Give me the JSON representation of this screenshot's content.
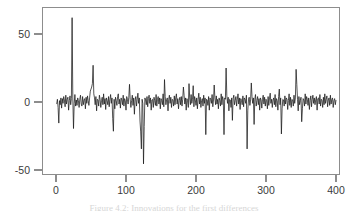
{
  "figure": {
    "caption": "Figure 4.2: Innovations for the first differences",
    "background": "#ffffff",
    "line_color": "#1a1a1a",
    "axis_color": "#8d8d8d"
  },
  "chart_data": {
    "type": "line",
    "title": "",
    "subtitle": "",
    "xlabel": "",
    "ylabel": "",
    "xlim": [
      -6,
      406
    ],
    "ylim": [
      -58,
      68
    ],
    "xticks": [
      0,
      100,
      200,
      300,
      400
    ],
    "xtick_labels": [
      "0",
      "100",
      "200",
      "300",
      "400"
    ],
    "yticks": [
      -50,
      0,
      50
    ],
    "ytick_labels": [
      "-50",
      "0",
      "50"
    ],
    "grid": false,
    "legend": null,
    "legend_position": "none",
    "frame": "box",
    "series": [
      {
        "name": "innovations",
        "x_start": 1,
        "x_step": 1,
        "values": [
          -1.5,
          2.0,
          -4.0,
          -15.5,
          1.0,
          -2.0,
          3.0,
          -4.5,
          2.5,
          -1.0,
          4.0,
          1.5,
          -3.5,
          5.0,
          -1.5,
          2.0,
          3.5,
          -6.0,
          1.0,
          4.5,
          -2.0,
          2.5,
          62.0,
          3.0,
          -19.5,
          -1.0,
          5.5,
          -3.0,
          1.5,
          -2.5,
          3.0,
          1.0,
          -4.0,
          2.0,
          5.0,
          -1.5,
          -3.0,
          4.0,
          -2.0,
          1.5,
          2.5,
          -5.0,
          3.5,
          -1.0,
          4.5,
          1.0,
          -2.5,
          3.0,
          8.0,
          9.5,
          11.0,
          13.5,
          27.0,
          6.0,
          3.0,
          -2.0,
          4.0,
          -6.5,
          2.0,
          1.5,
          -3.0,
          5.0,
          2.0,
          -4.0,
          1.0,
          3.5,
          -2.0,
          6.0,
          -1.5,
          2.5,
          -5.5,
          3.0,
          1.0,
          -2.0,
          4.0,
          -3.5,
          2.0,
          5.5,
          -1.0,
          3.0,
          -12.0,
          -21.5,
          2.0,
          -5.0,
          3.5,
          1.0,
          -2.5,
          4.0,
          6.0,
          -1.5,
          2.0,
          -4.5,
          3.0,
          1.5,
          -2.0,
          5.0,
          -3.0,
          2.5,
          1.0,
          -6.0,
          4.0,
          2.0,
          -1.5,
          3.5,
          13.0,
          2.0,
          -4.0,
          1.0,
          5.0,
          -2.5,
          3.0,
          -9.0,
          1.5,
          4.0,
          -3.0,
          2.0,
          6.5,
          -1.0,
          3.0,
          -14.0,
          -22.0,
          -34.5,
          2.0,
          -1.0,
          -45.5,
          -18.0,
          3.0,
          1.5,
          -2.0,
          4.0,
          -3.5,
          2.5,
          5.0,
          -1.0,
          3.0,
          -6.0,
          1.5,
          2.0,
          -4.0,
          3.5,
          1.0,
          -2.5,
          5.5,
          -3.0,
          2.0,
          4.0,
          -1.5,
          3.0,
          -5.0,
          2.5,
          1.0,
          -2.0,
          6.0,
          -3.5,
          16.5,
          4.0,
          -2.0,
          1.5,
          3.0,
          -6.5,
          2.0,
          5.0,
          -1.0,
          3.5,
          -4.0,
          2.0,
          1.5,
          -3.0,
          4.5,
          -2.0,
          3.0,
          6.0,
          -1.5,
          2.5,
          -5.0,
          1.0,
          3.5,
          -2.0,
          4.0,
          -3.0,
          2.0,
          11.0,
          5.0,
          -1.5,
          3.0,
          -6.0,
          2.5,
          1.0,
          -4.0,
          13.5,
          3.0,
          -2.0,
          5.5,
          -1.0,
          2.0,
          12.0,
          -3.5,
          4.0,
          1.5,
          -2.5,
          3.0,
          -5.0,
          2.0,
          6.5,
          -1.5,
          3.5,
          -4.0,
          1.0,
          2.5,
          -3.0,
          5.0,
          -1.0,
          3.0,
          -24.0,
          2.0,
          1.5,
          -2.5,
          4.0,
          -6.0,
          3.0,
          2.0,
          -1.0,
          5.5,
          -3.5,
          1.5,
          12.5,
          3.0,
          -2.0,
          4.5,
          -1.5,
          2.0,
          -5.0,
          3.0,
          1.0,
          -3.0,
          6.0,
          -2.0,
          4.0,
          1.5,
          -24.0,
          3.0,
          2.0,
          25.0,
          5.0,
          -1.0,
          3.5,
          -6.5,
          2.0,
          1.5,
          -4.0,
          3.0,
          -13.5,
          2.5,
          5.0,
          -2.0,
          1.0,
          4.0,
          -3.0,
          2.0,
          6.0,
          -1.5,
          3.0,
          -5.5,
          2.5,
          1.0,
          -2.0,
          4.5,
          -3.5,
          3.0,
          2.0,
          -1.0,
          5.0,
          -34.5,
          -6.0,
          2.0,
          3.5,
          -2.5,
          1.5,
          14.0,
          4.0,
          -1.0,
          3.0,
          -16.5,
          2.0,
          5.5,
          -3.0,
          1.0,
          4.0,
          -2.0,
          2.5,
          -6.0,
          3.0,
          1.5,
          -4.5,
          2.0,
          5.0,
          -1.5,
          3.5,
          -3.0,
          2.0,
          1.0,
          -5.0,
          4.0,
          -2.5,
          3.0,
          6.5,
          -1.0,
          2.0,
          -4.0,
          1.5,
          3.0,
          -2.0,
          5.5,
          -3.5,
          2.5,
          1.0,
          -6.0,
          4.0,
          9.5,
          -2.0,
          3.0,
          -23.5,
          -5.0,
          2.0,
          1.5,
          -3.0,
          4.5,
          -1.5,
          3.0,
          2.0,
          -5.5,
          1.0,
          6.0,
          -2.5,
          3.5,
          -4.0,
          2.0,
          1.5,
          -3.0,
          5.0,
          -1.0,
          3.0,
          24.0,
          13.0,
          2.0,
          -6.5,
          4.0,
          -2.0,
          1.0,
          3.5,
          -14.5,
          -5.0,
          2.5,
          1.5,
          -3.0,
          6.0,
          -1.5,
          4.0,
          2.0,
          -2.5,
          3.0,
          -5.5,
          1.0,
          4.5,
          -3.5,
          2.0,
          5.0,
          -1.0,
          3.0,
          -2.0,
          1.5,
          4.0,
          -6.0,
          2.5,
          3.0,
          -1.5,
          5.5,
          -3.0,
          2.0,
          1.0,
          -4.0,
          3.5,
          -2.0,
          6.0,
          -1.0,
          2.0,
          4.5,
          -3.5,
          1.5,
          3.0,
          -2.5,
          5.0,
          -1.5,
          2.0,
          3.0,
          -4.0,
          1.0,
          2.5,
          -2.0,
          1.5
        ]
      }
    ]
  }
}
